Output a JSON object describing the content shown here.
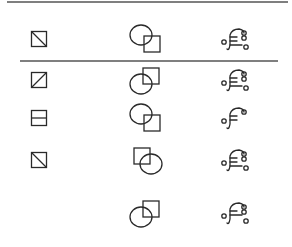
{
  "figure": {
    "colors": {
      "ink": "#2a2a2a",
      "rule": "#555555",
      "background": "#ffffff"
    },
    "columns": [
      "split-square",
      "circle-square",
      "hook-glyph"
    ],
    "header_row": {
      "split_square": {
        "division": "diagonal-tl-br"
      },
      "circle_square": {
        "square_relative_to_circle": "bottom-right"
      },
      "hook_glyph": {
        "bars": 3,
        "loops_right": 2,
        "loop_left": true,
        "loop_bottom_right": true
      }
    },
    "option_rows": [
      {
        "split_square": {
          "division": "diagonal-bl-tr"
        },
        "circle_square": {
          "square_relative_to_circle": "top-right"
        },
        "hook_glyph": {
          "bars": 3,
          "loops_right": 2,
          "loop_left": true,
          "loop_bottom_right": true
        }
      },
      {
        "split_square": {
          "division": "horizontal"
        },
        "circle_square": {
          "square_relative_to_circle": "bottom-right"
        },
        "hook_glyph": {
          "bars": 2,
          "loops_right": 1,
          "loop_left": true,
          "loop_bottom_right": false
        }
      },
      {
        "split_square": {
          "division": "diagonal-tl-br"
        },
        "circle_square": {
          "square_relative_to_circle": "top-left"
        },
        "hook_glyph": {
          "bars": 3,
          "loops_right": 2,
          "loop_left": true,
          "loop_bottom_right": true
        }
      },
      {
        "split_square": null,
        "circle_square": {
          "square_relative_to_circle": "top-right"
        },
        "hook_glyph": {
          "bars": 2,
          "loops_right": 2,
          "loop_left": true,
          "loop_bottom_right": true
        }
      }
    ]
  }
}
